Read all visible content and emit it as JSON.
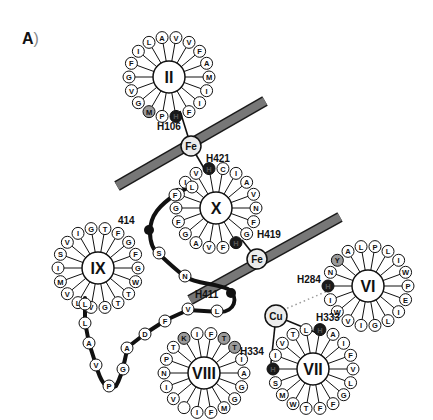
{
  "panel": {
    "label": "A",
    "paren": ")"
  },
  "colors": {
    "ink": "#111111",
    "membrane": "#6e6e6e",
    "metal_fill": "#ececec",
    "histidine_fill": "#1a1a1a",
    "highlight_fill": "#9a9a9a",
    "residue_fill": "#ffffff"
  },
  "metals": [
    {
      "id": "fe1",
      "label": "Fe",
      "x": 191,
      "y": 146
    },
    {
      "id": "fe2",
      "label": "Fe",
      "x": 257,
      "y": 259
    },
    {
      "id": "cu",
      "label": "Cu",
      "x": 276,
      "y": 316
    }
  ],
  "labels": [
    {
      "id": "h106",
      "text": "H106",
      "x": 157,
      "y": 130
    },
    {
      "id": "h421",
      "text": "H421",
      "x": 206,
      "y": 162
    },
    {
      "id": "h419",
      "text": "H419",
      "x": 257,
      "y": 238
    },
    {
      "id": "h284",
      "text": "H284",
      "x": 297,
      "y": 283
    },
    {
      "id": "h333",
      "text": "H333",
      "x": 316,
      "y": 321
    },
    {
      "id": "h334",
      "text": "H334",
      "x": 240,
      "y": 355
    },
    {
      "id": "h411",
      "text": "H411",
      "x": 195,
      "y": 298
    },
    {
      "id": "r414",
      "text": "414",
      "x": 118,
      "y": 224
    }
  ],
  "helices": [
    {
      "id": "II",
      "label": "II",
      "cx": 169,
      "cy": 77,
      "r_ring": 40,
      "residues": [
        {
          "aa": "V"
        },
        {
          "aa": "V"
        },
        {
          "aa": "F"
        },
        {
          "aa": "A"
        },
        {
          "aa": "M"
        },
        {
          "aa": "I"
        },
        {
          "aa": "I"
        },
        {
          "aa": "F"
        },
        {
          "aa": "H",
          "type": "his"
        },
        {
          "aa": "P"
        },
        {
          "aa": "M",
          "type": "hl"
        },
        {
          "aa": "G"
        },
        {
          "aa": "V"
        },
        {
          "aa": "G"
        },
        {
          "aa": "F"
        },
        {
          "aa": "I"
        },
        {
          "aa": "L"
        },
        {
          "aa": "A"
        }
      ]
    },
    {
      "id": "X",
      "label": "X",
      "cx": 216,
      "cy": 208,
      "r_ring": 40,
      "residues": [
        {
          "aa": "C"
        },
        {
          "aa": "I"
        },
        {
          "aa": "A"
        },
        {
          "aa": "V"
        },
        {
          "aa": "N"
        },
        {
          "aa": "F"
        },
        {
          "aa": "G"
        },
        {
          "aa": "H",
          "type": "his"
        },
        {
          "aa": "F"
        },
        {
          "aa": "V"
        },
        {
          "aa": "A"
        },
        {
          "aa": "G"
        },
        {
          "aa": "F"
        },
        {
          "aa": "G"
        },
        {
          "aa": "I"
        },
        {
          "aa": "I"
        },
        {
          "aa": "V"
        },
        {
          "aa": "H",
          "type": "his"
        }
      ]
    },
    {
      "id": "IX",
      "label": "IX",
      "cx": 98,
      "cy": 268,
      "r_ring": 40,
      "residues": [
        {
          "aa": "T"
        },
        {
          "aa": "F"
        },
        {
          "aa": "G"
        },
        {
          "aa": "F"
        },
        {
          "aa": "G"
        },
        {
          "aa": "W"
        },
        {
          "aa": "T"
        },
        {
          "aa": "T"
        },
        {
          "aa": "G"
        },
        {
          "aa": "V"
        },
        {
          "aa": "L"
        },
        {
          "aa": "V"
        },
        {
          "aa": "M"
        },
        {
          "aa": "I"
        },
        {
          "aa": "S"
        },
        {
          "aa": "V"
        },
        {
          "aa": "I"
        },
        {
          "aa": "G"
        }
      ]
    },
    {
      "id": "VI",
      "label": "VI",
      "cx": 368,
      "cy": 286,
      "r_ring": 40,
      "residues": [
        {
          "aa": "P"
        },
        {
          "aa": "L"
        },
        {
          "aa": "I"
        },
        {
          "aa": "W"
        },
        {
          "aa": "P"
        },
        {
          "aa": "E"
        },
        {
          "aa": "I"
        },
        {
          "aa": "L"
        },
        {
          "aa": "G"
        },
        {
          "aa": "I"
        },
        {
          "aa": "V"
        },
        {
          "aa": "W"
        },
        {
          "aa": "I"
        },
        {
          "aa": "H",
          "type": "his"
        },
        {
          "aa": "N"
        },
        {
          "aa": "Y",
          "type": "hl"
        },
        {
          "aa": "A"
        },
        {
          "aa": "L"
        }
      ]
    },
    {
      "id": "VII",
      "label": "VII",
      "cx": 313,
      "cy": 369,
      "r_ring": 40,
      "residues": [
        {
          "aa": "H",
          "type": "his"
        },
        {
          "aa": "A"
        },
        {
          "aa": "I"
        },
        {
          "aa": "F"
        },
        {
          "aa": "V"
        },
        {
          "aa": "L"
        },
        {
          "aa": "G"
        },
        {
          "aa": "F"
        },
        {
          "aa": "F"
        },
        {
          "aa": "T"
        },
        {
          "aa": "W"
        },
        {
          "aa": "M"
        },
        {
          "aa": "S"
        },
        {
          "aa": "H",
          "type": "his"
        },
        {
          "aa": "I"
        },
        {
          "aa": "V"
        },
        {
          "aa": "T"
        },
        {
          "aa": "L"
        }
      ]
    },
    {
      "id": "VIII",
      "label": "VIII",
      "cx": 204,
      "cy": 373,
      "r_ring": 40,
      "residues": [
        {
          "aa": "F"
        },
        {
          "aa": "T",
          "type": "hl"
        },
        {
          "aa": "T",
          "type": "hl"
        },
        {
          "aa": "I"
        },
        {
          "aa": "A"
        },
        {
          "aa": "G"
        },
        {
          "aa": "G"
        },
        {
          "aa": "M"
        },
        {
          "aa": "F"
        },
        {
          "aa": "I"
        },
        {
          "aa": ""
        },
        {
          "aa": "V"
        },
        {
          "aa": "I"
        },
        {
          "aa": "N"
        },
        {
          "aa": "P"
        },
        {
          "aa": "T"
        },
        {
          "aa": "K",
          "type": "hl"
        },
        {
          "aa": "I"
        }
      ]
    }
  ],
  "loop_residues": [
    {
      "aa": "L",
      "x": 192,
      "y": 187
    },
    {
      "aa": "F",
      "x": 175,
      "y": 195
    },
    {
      "aa": "S",
      "x": 159,
      "y": 253
    },
    {
      "aa": "N",
      "x": 185,
      "y": 276
    },
    {
      "aa": "L",
      "x": 217,
      "y": 311
    },
    {
      "aa": "V",
      "x": 188,
      "y": 309
    },
    {
      "aa": "F",
      "x": 165,
      "y": 321
    },
    {
      "aa": "D",
      "x": 145,
      "y": 334
    },
    {
      "aa": "A",
      "x": 127,
      "y": 348
    },
    {
      "aa": "G",
      "x": 123,
      "y": 369
    },
    {
      "aa": "P",
      "x": 109,
      "y": 386
    },
    {
      "aa": "V",
      "x": 96,
      "y": 365
    },
    {
      "aa": "A",
      "x": 89,
      "y": 343
    },
    {
      "aa": "L",
      "x": 85,
      "y": 323
    },
    {
      "aa": "L",
      "x": 85,
      "y": 304
    }
  ]
}
